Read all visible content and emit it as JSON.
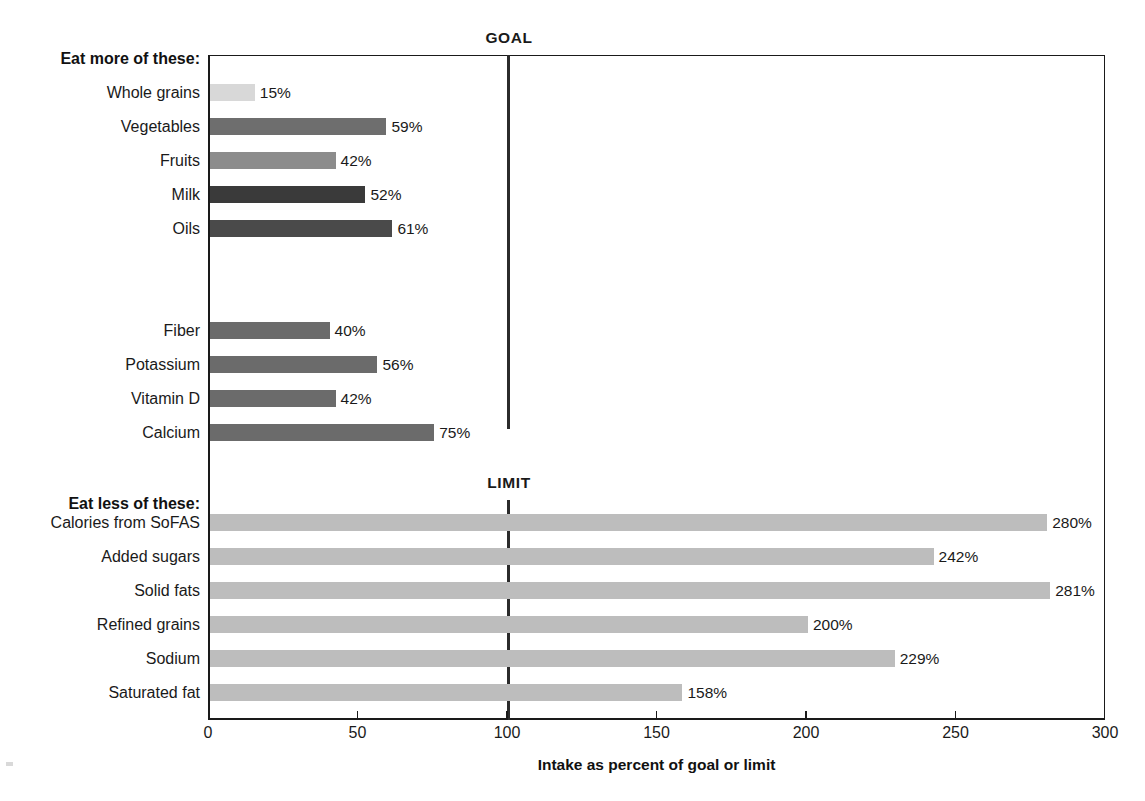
{
  "chart_data": {
    "type": "bar",
    "orientation": "horizontal",
    "title": "",
    "xlabel": "Intake as percent of goal or limit",
    "ylabel": "",
    "xlim": [
      0,
      300
    ],
    "xticks": [
      0,
      50,
      100,
      150,
      200,
      250,
      300
    ],
    "xtick_labels": [
      "0",
      "50",
      "100",
      "150",
      "200",
      "250",
      "300"
    ],
    "grid": false,
    "legend": "none",
    "reference_lines": [
      {
        "name": "goal",
        "label": "GOAL",
        "value": 100
      },
      {
        "name": "limit",
        "label": "LIMIT",
        "value": 100
      }
    ],
    "groups": [
      {
        "name": "eat-more",
        "header": "Eat more of these:",
        "categories": [
          "Whole grains",
          "Vegetables",
          "Fruits",
          "Milk",
          "Oils"
        ],
        "values": [
          15,
          59,
          42,
          52,
          61
        ],
        "value_labels": [
          "15%",
          "59%",
          "42%",
          "52%",
          "61%"
        ],
        "colors": [
          "#d8d8d8",
          "#6e6e6e",
          "#8c8c8c",
          "#3a3a3a",
          "#4a4a4a"
        ]
      },
      {
        "name": "eat-more-nutrients",
        "header": "",
        "categories": [
          "Fiber",
          "Potassium",
          "Vitamin D",
          "Calcium"
        ],
        "values": [
          40,
          56,
          42,
          75
        ],
        "value_labels": [
          "40%",
          "56%",
          "42%",
          "75%"
        ],
        "colors": [
          "#6b6b6b",
          "#6b6b6b",
          "#6b6b6b",
          "#6b6b6b"
        ]
      },
      {
        "name": "eat-less",
        "header": "Eat less of these:",
        "categories": [
          "Calories from SoFAS",
          "Added sugars",
          "Solid fats",
          "Refined grains",
          "Sodium",
          "Saturated fat"
        ],
        "values": [
          280,
          242,
          281,
          200,
          229,
          158
        ],
        "value_labels": [
          "280%",
          "242%",
          "281%",
          "200%",
          "229%",
          "158%"
        ],
        "colors": [
          "#bdbdbd",
          "#bdbdbd",
          "#bdbdbd",
          "#bdbdbd",
          "#bdbdbd",
          "#bdbdbd"
        ]
      }
    ]
  },
  "labels": {
    "header_more": "Eat more of these:",
    "header_less": "Eat less of these:",
    "goal": "GOAL",
    "limit": "LIMIT",
    "axis_title": "Intake as percent of goal or limit"
  },
  "rows": {
    "more": [
      {
        "category": "Whole grains",
        "value_label": "15%"
      },
      {
        "category": "Vegetables",
        "value_label": "59%"
      },
      {
        "category": "Fruits",
        "value_label": "42%"
      },
      {
        "category": "Milk",
        "value_label": "52%"
      },
      {
        "category": "Oils",
        "value_label": "61%"
      }
    ],
    "nutrients": [
      {
        "category": "Fiber",
        "value_label": "40%"
      },
      {
        "category": "Potassium",
        "value_label": "56%"
      },
      {
        "category": "Vitamin D",
        "value_label": "42%"
      },
      {
        "category": "Calcium",
        "value_label": "75%"
      }
    ],
    "less": [
      {
        "category": "Calories from SoFAS",
        "value_label": "280%"
      },
      {
        "category": "Added sugars",
        "value_label": "242%"
      },
      {
        "category": "Solid fats",
        "value_label": "281%"
      },
      {
        "category": "Refined grains",
        "value_label": "200%"
      },
      {
        "category": "Sodium",
        "value_label": "229%"
      },
      {
        "category": "Saturated fat",
        "value_label": "158%"
      }
    ]
  },
  "axis": {
    "ticks": [
      "0",
      "50",
      "100",
      "150",
      "200",
      "250",
      "300"
    ]
  }
}
